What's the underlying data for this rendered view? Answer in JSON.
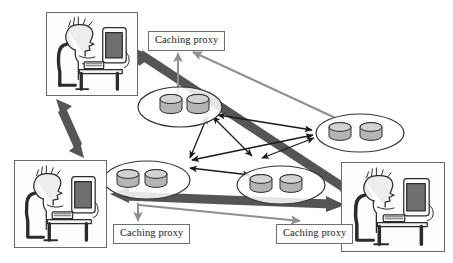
{
  "diagram": {
    "background_color": "#ffffff",
    "colors": {
      "thick_arrow": "#555555",
      "thin_gray_arrow": "#8f8f8f",
      "thin_black_arrow": "#1a1a1a",
      "disk_fill": "#b4b4b4",
      "disk_top": "#cfcfcf",
      "ellipse_stroke": "#333333",
      "label_border": "#6e6e6e",
      "label_text": "#1a1a1a",
      "panel_border": "#6a6a6a",
      "figure_ink": "#2b2b2b",
      "figure_shade": "#ededed",
      "monitor_screen": "#6f6f6f"
    }
  },
  "proxy_labels": [
    {
      "id": "proxy-top",
      "text": "Caching proxy"
    },
    {
      "id": "proxy-bottom-left",
      "text": "Caching proxy"
    },
    {
      "id": "proxy-bottom-right",
      "text": "Caching proxy"
    }
  ],
  "workstations": [
    {
      "id": "ws-top-left",
      "name": "user at computer, top left"
    },
    {
      "id": "ws-bottom-left",
      "name": "user at computer, bottom left"
    },
    {
      "id": "ws-bottom-right",
      "name": "user at computer, bottom right"
    }
  ],
  "database_clusters": [
    {
      "id": "cluster-top",
      "label": "",
      "disk_count": 2
    },
    {
      "id": "cluster-right",
      "label": "",
      "disk_count": 2
    },
    {
      "id": "cluster-bottom-left",
      "label": "",
      "disk_count": 2
    },
    {
      "id": "cluster-bottom-mid",
      "label": "",
      "disk_count": 2
    }
  ],
  "connections": {
    "thick_double_arrows": [
      {
        "id": "link-left-vertical",
        "from": "ws-top-left",
        "to": "ws-bottom-left"
      },
      {
        "id": "link-diagonal",
        "from": "ws-top-left",
        "to": "ws-bottom-right"
      },
      {
        "id": "link-bottom-horizontal",
        "from": "ws-bottom-left",
        "to": "ws-bottom-right"
      }
    ],
    "thin_gray_arrows": [
      {
        "id": "proxy-top-feed-left",
        "to": "proxy-top"
      },
      {
        "id": "proxy-top-feed-right",
        "to": "proxy-top",
        "from": "cluster-right"
      },
      {
        "id": "proxy-bl-feed",
        "to": "proxy-bottom-left"
      },
      {
        "id": "proxy-br-feed",
        "to": "proxy-bottom-right"
      }
    ],
    "thin_black_mesh": [
      {
        "from": "cluster-top",
        "to": "cluster-bottom-left"
      },
      {
        "from": "cluster-top",
        "to": "cluster-bottom-mid"
      },
      {
        "from": "cluster-top",
        "to": "cluster-right"
      },
      {
        "from": "cluster-bottom-left",
        "to": "cluster-bottom-mid"
      },
      {
        "from": "cluster-bottom-left",
        "to": "cluster-right"
      },
      {
        "from": "cluster-bottom-mid",
        "to": "cluster-right"
      }
    ]
  }
}
